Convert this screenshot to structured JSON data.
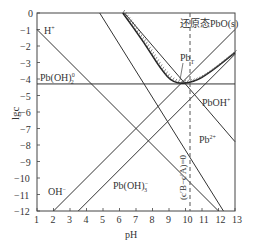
{
  "chart_data": {
    "type": "line",
    "title": "",
    "xlabel": "pH",
    "ylabel": "lgc",
    "xlim": [
      1,
      13
    ],
    "ylim": [
      -12,
      0
    ],
    "xticks": [
      "1",
      "2",
      "3",
      "4",
      "5",
      "6",
      "7",
      "8",
      "9",
      "10",
      "11",
      "12",
      "13"
    ],
    "yticks": [
      "0",
      "-1",
      "-2",
      "-3",
      "-4",
      "-5",
      "-6",
      "-7",
      "-8",
      "-9",
      "-10",
      "-11",
      "-12"
    ],
    "series": [
      {
        "name": "H+",
        "points": [
          [
            1,
            -1
          ],
          [
            12,
            -12
          ]
        ]
      },
      {
        "name": "OH-",
        "points": [
          [
            2,
            -12
          ],
          [
            13,
            -1
          ]
        ]
      },
      {
        "name": "Pb(OH)2^0",
        "points": [
          [
            1,
            -4.3
          ],
          [
            13,
            -4.3
          ]
        ]
      },
      {
        "name": "Pb2+",
        "points": [
          [
            4.8,
            0
          ],
          [
            12.3,
            -12
          ]
        ]
      },
      {
        "name": "PbOH+",
        "points": [
          [
            6.3,
            0
          ],
          [
            13,
            -7.8
          ]
        ]
      },
      {
        "name": "Pb(OH)3-",
        "points": [
          [
            3.5,
            -12
          ],
          [
            13,
            -2.5
          ]
        ]
      },
      {
        "name": "PbT",
        "points": [
          [
            6.2,
            0
          ],
          [
            7.5,
            -1.8
          ],
          [
            8.5,
            -3.4
          ],
          [
            9.3,
            -4.3
          ],
          [
            10.5,
            -4.2
          ],
          [
            11.5,
            -3.6
          ],
          [
            13,
            -2.4
          ]
        ]
      }
    ],
    "annotations": [
      "还原态PbO(s)",
      "PbT",
      "PbOH+",
      "Pb2+",
      "Pb(OH)3-",
      "OH-",
      "H+",
      "Pb(OH)2^0",
      "(c'B - c'A)=0"
    ],
    "vline": 9.3
  },
  "labels": {
    "h": "H",
    "h_sup": "+",
    "oh": "OH",
    "oh_sup": "−",
    "pboh2": "Pb(OH)",
    "pboh2_sup": "0",
    "pboh2_sub": "2",
    "pboh3": "Pb(OH)",
    "pboh3_sup": "−",
    "pboh3_sub": "3",
    "pboh": "PbOH",
    "pboh_sup": "+",
    "pb2": "Pb",
    "pb2_sup": "2+",
    "pbt": "Pb",
    "pbt_sub": "T",
    "pbo": "还原态PbO(s)",
    "vline": "(c′B−c′A)=0",
    "xlabel": "pH",
    "ylabel": "lgc"
  }
}
